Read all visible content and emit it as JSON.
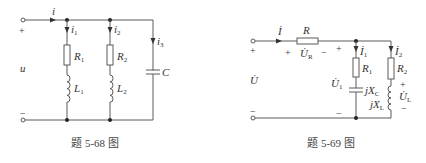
{
  "figures": [
    {
      "id": "fig-5-68",
      "caption": "题 5-68 图",
      "labels": {
        "current_total": "i",
        "current_1": "i",
        "current_1_sub": "1",
        "current_2": "i",
        "current_2_sub": "2",
        "current_3": "i",
        "current_3_sub": "3",
        "resistor_1": "R",
        "resistor_1_sub": "1",
        "resistor_2": "R",
        "resistor_2_sub": "2",
        "inductor_1": "L",
        "inductor_1_sub": "1",
        "inductor_2": "L",
        "inductor_2_sub": "2",
        "capacitor": "C",
        "voltage": "u",
        "plus": "+",
        "minus": "−"
      }
    },
    {
      "id": "fig-5-69",
      "caption": "题 5-69 图",
      "labels": {
        "current_total": "İ",
        "current_1": "İ",
        "current_1_sub": "1",
        "current_2": "İ",
        "current_2_sub": "2",
        "resistor": "R",
        "voltage_R": "U̇",
        "voltage_R_sub": "R",
        "resistor_1": "R",
        "resistor_1_sub": "1",
        "resistor_2": "R",
        "resistor_2_sub": "2",
        "reactance_C": "jX",
        "reactance_C_sub": "C",
        "reactance_L": "jX",
        "reactance_L_sub": "L",
        "voltage_1": "U̇",
        "voltage_1_sub": "1",
        "voltage_L": "U̇",
        "voltage_L_sub": "L",
        "voltage_total": "U̇",
        "plus": "+",
        "minus": "−"
      }
    }
  ]
}
